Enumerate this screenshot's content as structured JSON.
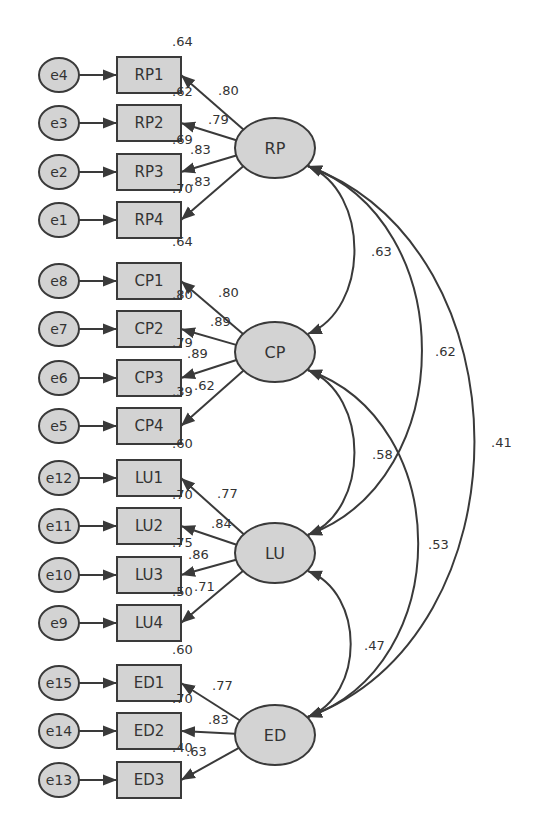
{
  "diagram": {
    "type": "structural-equation-model (CFA)",
    "colors": {
      "node_fill": "#d3d3d3",
      "stroke": "#3a3a3a",
      "text": "#333333",
      "background": "#ffffff"
    },
    "latents": [
      {
        "id": "RP",
        "label": "RP",
        "cx": 275,
        "cy": 148
      },
      {
        "id": "CP",
        "label": "CP",
        "cx": 275,
        "cy": 352
      },
      {
        "id": "LU",
        "label": "LU",
        "cx": 275,
        "cy": 553
      },
      {
        "id": "ED",
        "label": "ED",
        "cx": 275,
        "cy": 735
      }
    ],
    "indicators": [
      {
        "id": "RP1",
        "label": "RP1",
        "error": "e4",
        "latent": "RP",
        "y": 75,
        "loading": ".80",
        "r2": ".64"
      },
      {
        "id": "RP2",
        "label": "RP2",
        "error": "e3",
        "latent": "RP",
        "y": 123,
        "loading": ".79",
        "r2": ".62"
      },
      {
        "id": "RP3",
        "label": "RP3",
        "error": "e2",
        "latent": "RP",
        "y": 172,
        "loading": ".83",
        "r2": ".69"
      },
      {
        "id": "RP4",
        "label": "RP4",
        "error": "e1",
        "latent": "RP",
        "y": 220,
        "loading": ".83",
        "r2": ".70"
      },
      {
        "id": "CP1",
        "label": "CP1",
        "error": "e8",
        "latent": "CP",
        "y": 281,
        "loading": ".80",
        "r2": ".64"
      },
      {
        "id": "CP2",
        "label": "CP2",
        "error": "e7",
        "latent": "CP",
        "y": 329,
        "loading": ".89",
        "r2": ".80"
      },
      {
        "id": "CP3",
        "label": "CP3",
        "error": "e6",
        "latent": "CP",
        "y": 378,
        "loading": ".89",
        "r2": ".79"
      },
      {
        "id": "CP4",
        "label": "CP4",
        "error": "e5",
        "latent": "CP",
        "y": 426,
        "loading": ".62",
        "r2": ".39"
      },
      {
        "id": "LU1",
        "label": "LU1",
        "error": "e12",
        "latent": "LU",
        "y": 478,
        "loading": ".77",
        "r2": ".60"
      },
      {
        "id": "LU2",
        "label": "LU2",
        "error": "e11",
        "latent": "LU",
        "y": 526,
        "loading": ".84",
        "r2": ".70"
      },
      {
        "id": "LU3",
        "label": "LU3",
        "error": "e10",
        "latent": "LU",
        "y": 575,
        "loading": ".86",
        "r2": ".75"
      },
      {
        "id": "LU4",
        "label": "LU4",
        "error": "e9",
        "latent": "LU",
        "y": 623,
        "loading": ".71",
        "r2": ".50"
      },
      {
        "id": "ED1",
        "label": "ED1",
        "error": "e15",
        "latent": "ED",
        "y": 683,
        "loading": ".77",
        "r2": ".60"
      },
      {
        "id": "ED2",
        "label": "ED2",
        "error": "e14",
        "latent": "ED",
        "y": 731,
        "loading": ".83",
        "r2": ".70"
      },
      {
        "id": "ED3",
        "label": "ED3",
        "error": "e13",
        "latent": "ED",
        "y": 780,
        "loading": ".63",
        "r2": ".40"
      }
    ],
    "r2_labels": [
      {
        "for": "RP1",
        "text": ".64",
        "x": 172,
        "y": 46
      },
      {
        "for": "RP2",
        "text": ".62",
        "x": 172,
        "y": 96
      },
      {
        "for": "RP3",
        "text": ".69",
        "x": 172,
        "y": 144
      },
      {
        "for": "RP4",
        "text": ".70",
        "x": 172,
        "y": 193
      },
      {
        "for": "CP1",
        "text": ".64",
        "x": 172,
        "y": 246
      },
      {
        "for": "CP2",
        "text": ".80",
        "x": 172,
        "y": 299
      },
      {
        "for": "CP3",
        "text": ".79",
        "x": 172,
        "y": 347
      },
      {
        "for": "CP4",
        "text": ".39",
        "x": 172,
        "y": 396
      },
      {
        "for": "LU1",
        "text": ".60",
        "x": 172,
        "y": 448
      },
      {
        "for": "LU2",
        "text": ".70",
        "x": 172,
        "y": 499
      },
      {
        "for": "LU3",
        "text": ".75",
        "x": 172,
        "y": 547
      },
      {
        "for": "LU4",
        "text": ".50",
        "x": 172,
        "y": 596
      },
      {
        "for": "ED1",
        "text": ".60",
        "x": 172,
        "y": 654
      },
      {
        "for": "ED2",
        "text": ".70",
        "x": 172,
        "y": 703
      },
      {
        "for": "ED3",
        "text": ".40",
        "x": 172,
        "y": 752
      }
    ],
    "loading_labels": [
      {
        "for": "RP1",
        "text": ".80",
        "x": 218,
        "y": 95
      },
      {
        "for": "RP2",
        "text": ".79",
        "x": 208,
        "y": 124
      },
      {
        "for": "RP3",
        "text": ".83",
        "x": 190,
        "y": 154
      },
      {
        "for": "RP4",
        "text": ".83",
        "x": 190,
        "y": 186
      },
      {
        "for": "CP1",
        "text": ".80",
        "x": 218,
        "y": 297
      },
      {
        "for": "CP2",
        "text": ".89",
        "x": 210,
        "y": 326
      },
      {
        "for": "CP3",
        "text": ".89",
        "x": 187,
        "y": 358
      },
      {
        "for": "CP4",
        "text": ".62",
        "x": 194,
        "y": 390
      },
      {
        "for": "LU1",
        "text": ".77",
        "x": 217,
        "y": 498
      },
      {
        "for": "LU2",
        "text": ".84",
        "x": 211,
        "y": 528
      },
      {
        "for": "LU3",
        "text": ".86",
        "x": 188,
        "y": 559
      },
      {
        "for": "LU4",
        "text": ".71",
        "x": 194,
        "y": 591
      },
      {
        "for": "ED1",
        "text": ".77",
        "x": 212,
        "y": 690
      },
      {
        "for": "ED2",
        "text": ".83",
        "x": 208,
        "y": 724
      },
      {
        "for": "ED3",
        "text": ".63",
        "x": 186,
        "y": 756
      }
    ],
    "covariances": [
      {
        "from": "RP",
        "to": "CP",
        "value": ".63",
        "label_x": 371,
        "label_y": 256
      },
      {
        "from": "RP",
        "to": "LU",
        "value": ".62",
        "label_x": 435,
        "label_y": 356
      },
      {
        "from": "RP",
        "to": "ED",
        "value": ".41",
        "label_x": 491,
        "label_y": 447
      },
      {
        "from": "CP",
        "to": "LU",
        "value": ".58",
        "label_x": 372,
        "label_y": 459
      },
      {
        "from": "CP",
        "to": "ED",
        "value": ".53",
        "label_x": 428,
        "label_y": 549
      },
      {
        "from": "LU",
        "to": "ED",
        "value": ".47",
        "label_x": 364,
        "label_y": 650
      }
    ]
  }
}
